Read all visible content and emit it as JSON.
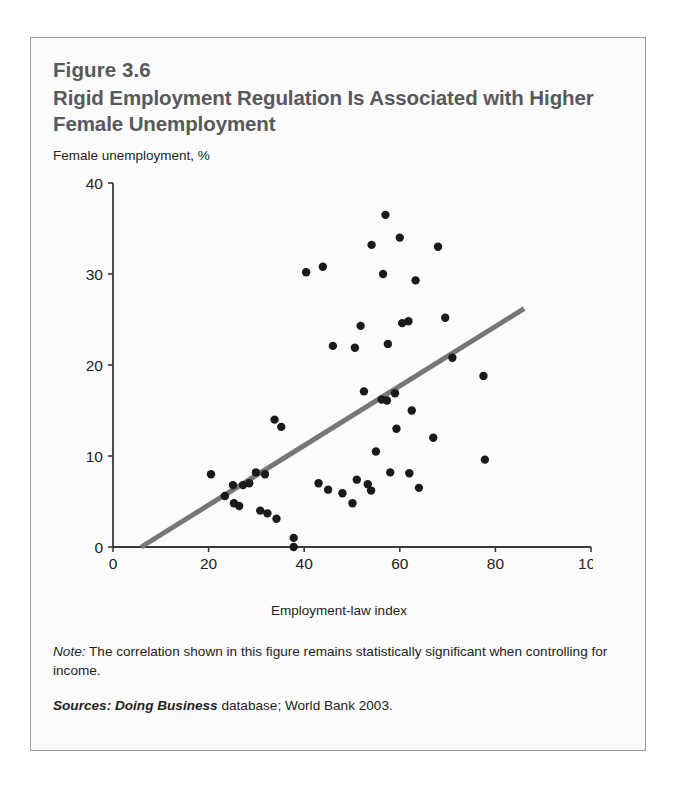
{
  "figure": {
    "number": "Figure 3.6",
    "title": "Rigid Employment Regulation Is Associated with Higher Female Unemployment",
    "note_label": "Note:",
    "note_text": " The correlation shown in this figure remains statistically significant when controlling for income.",
    "sources_label": "Sources:",
    "sources_italic": " Doing Business",
    "sources_text": " database; World Bank 2003."
  },
  "chart_data": {
    "type": "scatter",
    "title": "Rigid Employment Regulation Is Associated with Higher Female Unemployment",
    "subtitle": "Figure 3.6",
    "xlabel": "Employment-law index",
    "ylabel": "Female unemployment, %",
    "ylabel_position": "above-axis",
    "xlim": [
      0,
      100
    ],
    "ylim": [
      0,
      40
    ],
    "xticks": [
      0,
      20,
      40,
      60,
      80,
      100
    ],
    "yticks": [
      0,
      10,
      20,
      30,
      40
    ],
    "grid": false,
    "legend": false,
    "marker_color": "#1a1a1a",
    "marker_size": 4.2,
    "trendline": {
      "label": "fitted regression line",
      "color": "#767676",
      "width": 5,
      "x0": 5.9,
      "y0": 0.0,
      "x1": 86.0,
      "y1": 26.2
    },
    "points": [
      {
        "x": 20.5,
        "y": 8.0
      },
      {
        "x": 23.4,
        "y": 5.6
      },
      {
        "x": 25.3,
        "y": 4.8
      },
      {
        "x": 26.4,
        "y": 4.5
      },
      {
        "x": 25.1,
        "y": 6.8
      },
      {
        "x": 27.2,
        "y": 6.8
      },
      {
        "x": 28.5,
        "y": 7.0
      },
      {
        "x": 29.9,
        "y": 8.2
      },
      {
        "x": 31.8,
        "y": 8.0
      },
      {
        "x": 30.8,
        "y": 4.0
      },
      {
        "x": 32.3,
        "y": 3.7
      },
      {
        "x": 34.2,
        "y": 3.1
      },
      {
        "x": 33.8,
        "y": 14.0
      },
      {
        "x": 35.2,
        "y": 13.2
      },
      {
        "x": 37.8,
        "y": 1.0
      },
      {
        "x": 37.8,
        "y": 0.0
      },
      {
        "x": 40.4,
        "y": 30.2
      },
      {
        "x": 43.9,
        "y": 30.8
      },
      {
        "x": 43.0,
        "y": 7.0
      },
      {
        "x": 45.0,
        "y": 6.3
      },
      {
        "x": 46.0,
        "y": 22.1
      },
      {
        "x": 48.0,
        "y": 5.9
      },
      {
        "x": 50.1,
        "y": 4.8
      },
      {
        "x": 50.6,
        "y": 21.9
      },
      {
        "x": 51.8,
        "y": 24.3
      },
      {
        "x": 51.0,
        "y": 7.4
      },
      {
        "x": 53.3,
        "y": 6.9
      },
      {
        "x": 54.0,
        "y": 6.2
      },
      {
        "x": 52.5,
        "y": 17.1
      },
      {
        "x": 54.1,
        "y": 33.2
      },
      {
        "x": 55.0,
        "y": 10.5
      },
      {
        "x": 56.5,
        "y": 30.0
      },
      {
        "x": 57.0,
        "y": 36.5
      },
      {
        "x": 56.2,
        "y": 16.2
      },
      {
        "x": 57.3,
        "y": 16.1
      },
      {
        "x": 57.5,
        "y": 22.3
      },
      {
        "x": 58.0,
        "y": 8.2
      },
      {
        "x": 59.0,
        "y": 16.9
      },
      {
        "x": 59.3,
        "y": 13.0
      },
      {
        "x": 60.0,
        "y": 34.0
      },
      {
        "x": 60.5,
        "y": 24.6
      },
      {
        "x": 61.8,
        "y": 24.8
      },
      {
        "x": 62.0,
        "y": 8.1
      },
      {
        "x": 62.5,
        "y": 15.0
      },
      {
        "x": 63.3,
        "y": 29.3
      },
      {
        "x": 64.0,
        "y": 6.5
      },
      {
        "x": 67.0,
        "y": 12.0
      },
      {
        "x": 68.0,
        "y": 33.0
      },
      {
        "x": 69.5,
        "y": 25.2
      },
      {
        "x": 71.0,
        "y": 20.8
      },
      {
        "x": 77.5,
        "y": 18.8
      },
      {
        "x": 77.8,
        "y": 9.6
      }
    ]
  },
  "icons": {}
}
